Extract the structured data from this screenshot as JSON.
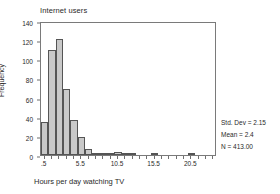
{
  "chart_data": {
    "type": "bar",
    "title": "Internet users",
    "xlabel": "Hours per day watching TV",
    "ylabel": "Frequency",
    "grid": false,
    "legend": null,
    "ylim": [
      0,
      140
    ],
    "xlim": [
      0,
      24
    ],
    "bin_width": 1,
    "yticks": [
      0,
      20,
      40,
      60,
      80,
      100,
      120,
      140
    ],
    "ytick_labels": [
      "0",
      "20",
      "40",
      "60",
      "80",
      "100",
      "120",
      "140"
    ],
    "xticks": [
      0.5,
      5.5,
      10.5,
      15.5,
      20.5
    ],
    "xtick_labels": [
      ".5",
      "5.5",
      "10.5",
      "15.5",
      "20.5"
    ],
    "x_minor_tick_step": 1,
    "categories": [
      "0.5",
      "1.5",
      "2.5",
      "3.5",
      "4.5",
      "5.5",
      "6.5",
      "7.5",
      "8.5",
      "9.5",
      "10.5",
      "11.5",
      "12.5",
      "13.5",
      "14.5",
      "15.5",
      "16.5",
      "17.5",
      "18.5",
      "19.5",
      "20.5",
      "21.5",
      "22.5",
      "23.5"
    ],
    "values": [
      35,
      110,
      121,
      69,
      37,
      19,
      6,
      1,
      2,
      2,
      3,
      1,
      1,
      0,
      0,
      1,
      0,
      0,
      0,
      0,
      1,
      0,
      0,
      0
    ],
    "annotations": [
      "Std. Dev = 2.15",
      "Mean = 2.4",
      "N = 413.00"
    ]
  },
  "stats": {
    "std_dev": "Std. Dev = 2.15",
    "mean": "Mean = 2.4",
    "n": "N = 413.00"
  },
  "colors": {
    "bar_fill": "#c9c9c9",
    "bar_edge": "#555555",
    "frame": "#7a7a7a",
    "text": "#2a2a2a",
    "background": "#ffffff"
  }
}
